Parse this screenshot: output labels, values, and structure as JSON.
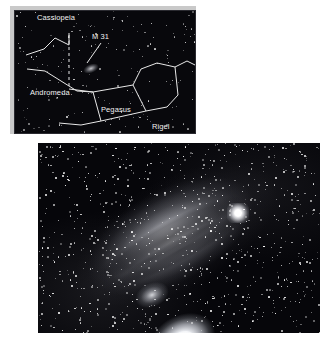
{
  "figure": {
    "type": "astronomy-photograph-with-finder-chart",
    "background_color": "#ffffff"
  },
  "star_chart": {
    "name": "finder-chart-inset",
    "background_color": "#08080c",
    "line_color": "#e8e8e8",
    "label_color": "#f2f2f2",
    "labels": [
      {
        "text": "Cassiopeia",
        "x": 22,
        "y": 3
      },
      {
        "text": "M 31",
        "x": 77,
        "y": 22
      },
      {
        "text": "Andromeda",
        "x": 15,
        "y": 78
      },
      {
        "text": "Pegasus",
        "x": 86,
        "y": 95
      },
      {
        "text": "Rigel",
        "x": 137,
        "y": 112
      }
    ],
    "annotations": {
      "pointer_line": "leader line from M 31 label down-left to the M 31 smudge",
      "dashed_line": "vertical dashed guide line from Cassiopeia down to Andromeda"
    },
    "objects": [
      {
        "name": "M 31",
        "kind": "galaxy-smudge"
      }
    ]
  },
  "photograph": {
    "name": "andromeda-galaxy-photograph",
    "subject": "M 31",
    "background_color": "#06060a",
    "objects": [
      {
        "name": "M 31 core",
        "kind": "galactic-nucleus"
      },
      {
        "name": "M 32",
        "kind": "companion-galaxy"
      },
      {
        "name": "NGC 205",
        "kind": "companion-galaxy"
      }
    ]
  }
}
